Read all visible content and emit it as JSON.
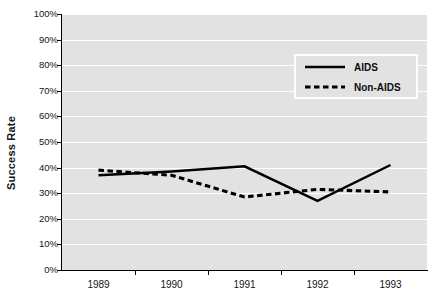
{
  "chart_data": {
    "type": "line",
    "title": "",
    "xlabel": "",
    "ylabel": "Success Rate",
    "x": [
      "1989",
      "1990",
      "1991",
      "1992",
      "1993"
    ],
    "categories": [
      "1989",
      "1990",
      "1991",
      "1992",
      "1993"
    ],
    "series": [
      {
        "name": "AIDS",
        "style": "solid",
        "color": "#000000",
        "values": [
          37,
          38.5,
          40.5,
          27,
          41
        ]
      },
      {
        "name": "Non-AIDS",
        "style": "dashed",
        "color": "#000000",
        "values": [
          39,
          37,
          28.5,
          31.5,
          30.5
        ]
      }
    ],
    "ylim": [
      0,
      100
    ],
    "ytick_values": [
      100,
      90,
      80,
      70,
      60,
      50,
      40,
      30,
      20,
      10,
      0
    ],
    "ytick_labels": [
      "100%",
      "90%",
      "80%",
      "70%",
      "60%",
      "50%",
      "40%",
      "30%",
      "20%",
      "10%",
      "0%"
    ],
    "grid": true,
    "grid_axis": "y",
    "legend_position": "upper right",
    "plot_background": "#e2e2e2",
    "gridline_color": "#ffffff",
    "axis_color": "#000000"
  },
  "axes": {
    "y_title": "Success Rate"
  },
  "legend": {
    "entries": [
      {
        "label": "AIDS",
        "key": "solid-line-key"
      },
      {
        "label": "Non-AIDS",
        "key": "dashed-line-key"
      }
    ]
  }
}
